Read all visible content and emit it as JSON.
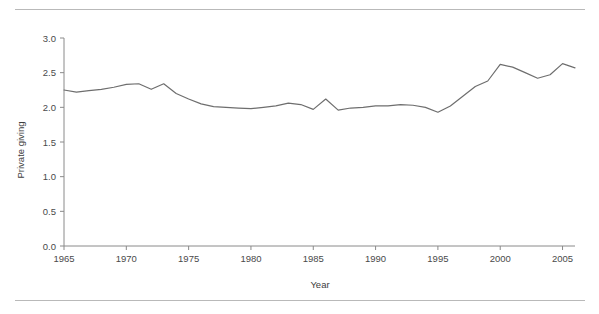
{
  "figure": {
    "top_rule": "horizontal-rule",
    "bottom_rule": "horizontal-rule"
  },
  "chart_data": {
    "type": "line",
    "title": "",
    "subtitle": "",
    "xlabel": "Year",
    "ylabel": "Private giving",
    "xlim": [
      1965,
      2006
    ],
    "ylim": [
      0.0,
      3.0
    ],
    "grid": false,
    "legend": null,
    "line_color": "#6e6e6e",
    "axis_color": "#8a8a8a",
    "xticks": [
      1965,
      1970,
      1975,
      1980,
      1985,
      1990,
      1995,
      2000,
      2005
    ],
    "xtick_labels": [
      "1965",
      "1970",
      "1975",
      "1980",
      "1985",
      "1990",
      "1995",
      "2000",
      "2005"
    ],
    "yticks": [
      0.0,
      0.5,
      1.0,
      1.5,
      2.0,
      2.5,
      3.0
    ],
    "ytick_labels": [
      "0.0",
      "0.5",
      "1.0",
      "1.5",
      "2.0",
      "2.5",
      "3.0"
    ],
    "x": [
      1965,
      1966,
      1967,
      1968,
      1969,
      1970,
      1971,
      1972,
      1973,
      1974,
      1975,
      1976,
      1977,
      1978,
      1979,
      1980,
      1981,
      1982,
      1983,
      1984,
      1985,
      1986,
      1987,
      1988,
      1989,
      1990,
      1991,
      1992,
      1993,
      1994,
      1995,
      1996,
      1997,
      1998,
      1999,
      2000,
      2001,
      2002,
      2003,
      2004,
      2005,
      2006
    ],
    "values": [
      2.25,
      2.22,
      2.24,
      2.26,
      2.29,
      2.33,
      2.34,
      2.26,
      2.34,
      2.2,
      2.12,
      2.05,
      2.01,
      2.0,
      1.99,
      1.98,
      2.0,
      2.02,
      2.06,
      2.04,
      1.97,
      2.12,
      1.96,
      1.99,
      2.0,
      2.02,
      2.02,
      2.04,
      2.03,
      2.0,
      1.93,
      2.02,
      2.16,
      2.3,
      2.38,
      2.62,
      2.58,
      2.5,
      2.42,
      2.47,
      2.63,
      2.57
    ],
    "series": [
      {
        "name": "Private giving",
        "values": [
          2.25,
          2.22,
          2.24,
          2.26,
          2.29,
          2.33,
          2.34,
          2.26,
          2.34,
          2.2,
          2.12,
          2.05,
          2.01,
          2.0,
          1.99,
          1.98,
          2.0,
          2.02,
          2.06,
          2.04,
          1.97,
          2.12,
          1.96,
          1.99,
          2.0,
          2.02,
          2.02,
          2.04,
          2.03,
          2.0,
          1.93,
          2.02,
          2.16,
          2.3,
          2.38,
          2.62,
          2.58,
          2.5,
          2.42,
          2.47,
          2.63,
          2.57
        ]
      }
    ]
  }
}
